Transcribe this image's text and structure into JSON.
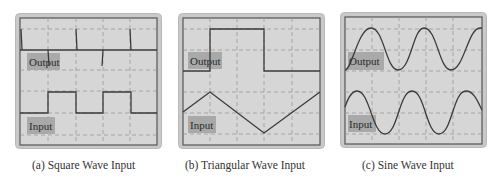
{
  "colors": {
    "frame_outer": "#c9c9c9",
    "frame_border": "#b0b0b0",
    "screen_bg": "#d6d6d6",
    "screen_border": "#555555",
    "grid": "#9a9a9a",
    "trace": "#3a3a3a",
    "label_bg": "#a9a9a9"
  },
  "panels": [
    {
      "id": "a",
      "caption": "(a) Square Wave Input",
      "output_label": "Output",
      "input_label": "Input",
      "input_waveform": "square",
      "output_waveform": "spikes (differentiated square)"
    },
    {
      "id": "b",
      "caption": "(b) Triangular Wave Input",
      "output_label": "Output",
      "input_label": "Input",
      "input_waveform": "triangle",
      "output_waveform": "square"
    },
    {
      "id": "c",
      "caption": "(c) Sine Wave Input",
      "output_label": "Output",
      "input_label": "Input",
      "input_waveform": "sine",
      "output_waveform": "cosine (phase-shifted sine)"
    }
  ]
}
